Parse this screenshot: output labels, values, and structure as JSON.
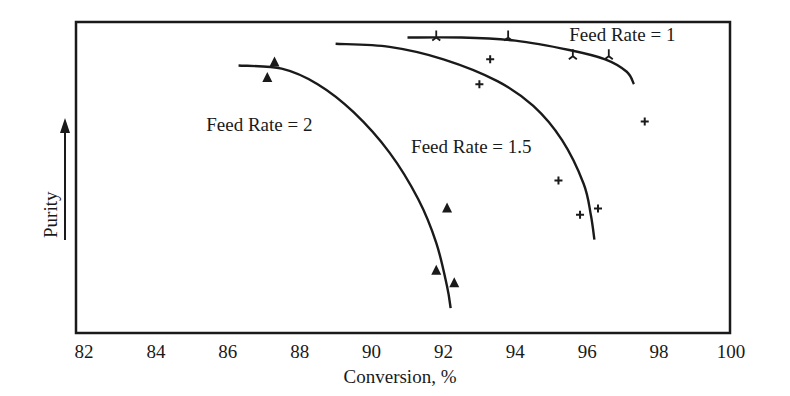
{
  "chart_data": {
    "type": "scatter",
    "title": "",
    "xlabel": "Conversion, %",
    "ylabel": "Purity",
    "xlim": [
      82,
      100
    ],
    "ylim": [
      0,
      100
    ],
    "y_note": "Purity axis has no numeric ticks; values are relative (0 = bottom of frame, 100 = top)",
    "x_ticks": [
      82,
      84,
      86,
      88,
      90,
      92,
      94,
      96,
      98,
      100
    ],
    "grid": false,
    "legend": "none (curves labeled inline)",
    "series": [
      {
        "name": "Feed Rate = 2",
        "marker": "filled-triangle",
        "points": [
          {
            "x": 87.3,
            "y": 87
          },
          {
            "x": 87.1,
            "y": 82
          },
          {
            "x": 92.1,
            "y": 40
          },
          {
            "x": 91.8,
            "y": 20
          },
          {
            "x": 92.3,
            "y": 16
          }
        ],
        "curve": [
          {
            "x": 86.3,
            "y": 86
          },
          {
            "x": 87.5,
            "y": 85
          },
          {
            "x": 88.5,
            "y": 80
          },
          {
            "x": 89.5,
            "y": 71
          },
          {
            "x": 90.5,
            "y": 58
          },
          {
            "x": 91.3,
            "y": 43
          },
          {
            "x": 91.8,
            "y": 29
          },
          {
            "x": 92.1,
            "y": 15
          },
          {
            "x": 92.2,
            "y": 8
          }
        ]
      },
      {
        "name": "Feed Rate = 1.5",
        "marker": "plus",
        "points": [
          {
            "x": 93.3,
            "y": 88
          },
          {
            "x": 93.0,
            "y": 80
          },
          {
            "x": 95.2,
            "y": 49
          },
          {
            "x": 95.8,
            "y": 38
          },
          {
            "x": 96.3,
            "y": 40
          },
          {
            "x": 97.6,
            "y": 68
          }
        ],
        "curve": [
          {
            "x": 89.0,
            "y": 93
          },
          {
            "x": 90.5,
            "y": 92
          },
          {
            "x": 92.0,
            "y": 88
          },
          {
            "x": 93.5,
            "y": 81
          },
          {
            "x": 94.5,
            "y": 73
          },
          {
            "x": 95.3,
            "y": 62
          },
          {
            "x": 95.9,
            "y": 48
          },
          {
            "x": 96.1,
            "y": 38
          },
          {
            "x": 96.2,
            "y": 30
          }
        ]
      },
      {
        "name": "Feed Rate = 1",
        "marker": "tick-cross",
        "points": [
          {
            "x": 91.8,
            "y": 95
          },
          {
            "x": 93.8,
            "y": 95
          },
          {
            "x": 95.6,
            "y": 89
          },
          {
            "x": 96.6,
            "y": 89
          }
        ],
        "curve": [
          {
            "x": 91.0,
            "y": 95
          },
          {
            "x": 92.5,
            "y": 95
          },
          {
            "x": 94.0,
            "y": 94
          },
          {
            "x": 95.5,
            "y": 91
          },
          {
            "x": 96.5,
            "y": 88
          },
          {
            "x": 97.1,
            "y": 84
          },
          {
            "x": 97.3,
            "y": 80
          }
        ]
      }
    ],
    "annotations": [
      {
        "text": "Feed Rate = 1",
        "x": 95.5,
        "y": 94
      },
      {
        "text": "Feed Rate = 1.5",
        "x": 91.1,
        "y": 58
      },
      {
        "text": "Feed Rate = 2",
        "x": 85.4,
        "y": 65
      }
    ]
  }
}
